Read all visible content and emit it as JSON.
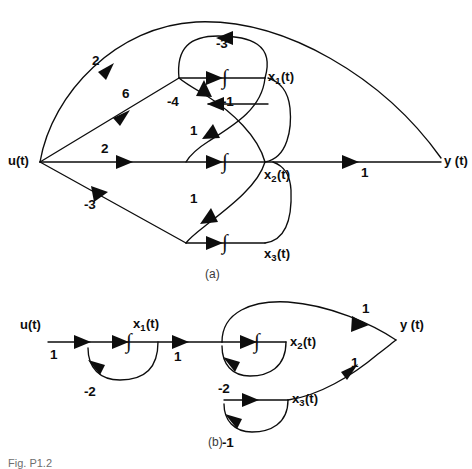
{
  "figure": {
    "caption_a": "(a)",
    "caption_b": "(b)",
    "figure_label": "Fig. P1.2",
    "integrator_symbol": "∫"
  },
  "diagram_a": {
    "nodes": {
      "input": "u(t)",
      "output": "y (t)",
      "x1_base": "x",
      "x1_sub": "1",
      "x1_tail": "(t)",
      "x2_base": "x",
      "x2_sub": "2",
      "x2_tail": "(t)",
      "x3_base": "x",
      "x3_sub": "3",
      "x3_tail": "(t)"
    },
    "gains": {
      "u_to_x1dot": "2",
      "u_to_mid": "6",
      "u_to_x2dot": "2",
      "u_to_x3dot": "-3",
      "x1_self_loop": "-3",
      "x2_to_x1dot": "-4",
      "x1_feedback": "-1",
      "x1_to_x2dot": "1",
      "x2_to_x3dot": "1",
      "x2_to_y": "1"
    }
  },
  "diagram_b": {
    "nodes": {
      "input": "u(t)",
      "output": "y (t)",
      "x1_base": "x",
      "x1_sub": "1",
      "x1_tail": "(t)",
      "x2_base": "x",
      "x2_sub": "2",
      "x2_tail": "(t)",
      "x3_base": "x",
      "x3_sub": "3",
      "x3_tail": "(t)"
    },
    "gains": {
      "u_in": "1",
      "x1_loop": "-2",
      "x1_to_x2": "1",
      "x2_loop": "-2",
      "x3_loop": "-1",
      "x2_to_y": "1",
      "x3_to_y": "1"
    }
  }
}
